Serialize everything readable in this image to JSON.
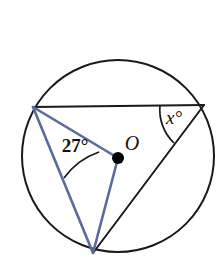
{
  "figure": {
    "type": "circle-geometry-diagram",
    "background_color": "#ffffff",
    "canvas": {
      "width": 223,
      "height": 274
    }
  },
  "colors": {
    "stroke_black": "#1a1a1a",
    "stroke_blue": "#5b6a9c",
    "center_dot": "#000000",
    "text": "#111111",
    "background": "#ffffff"
  },
  "circle": {
    "name": "main-circle",
    "center_x": 118,
    "center_y": 156,
    "radius": 96,
    "stroke_width": 2.0
  },
  "points": {
    "center": {
      "label": "O",
      "x": 118,
      "y": 158
    },
    "left_vertex": {
      "label": "",
      "x": 33,
      "y": 107
    },
    "right_vertex": {
      "label": "",
      "x": 204,
      "y": 105
    },
    "bottom_vertex": {
      "label": "",
      "x": 93,
      "y": 253
    }
  },
  "segments": [
    {
      "name": "chord-top",
      "color": "black",
      "from": "left_vertex",
      "to": "right_vertex",
      "width": 2.0
    },
    {
      "name": "chord-right-to-bottom",
      "color": "black",
      "from": "right_vertex",
      "to": "bottom_vertex",
      "width": 2.0
    },
    {
      "name": "radius-left-to-center",
      "color": "blue",
      "from": "left_vertex",
      "to": "center",
      "width": 2.6
    },
    {
      "name": "chord-left-to-bottom",
      "color": "blue",
      "from": "left_vertex",
      "to": "bottom_vertex",
      "width": 2.6
    },
    {
      "name": "radius-center-to-bottom",
      "color": "blue",
      "from": "center",
      "to": "bottom_vertex",
      "width": 2.6
    }
  ],
  "angles": [
    {
      "id": "angle-27",
      "label": "27°",
      "value": 27,
      "unit": "degrees",
      "vertex": "left_vertex",
      "label_x": 75,
      "label_y": 152,
      "font_size": 19,
      "italic": false,
      "arc_stroke": "#1a1a1a"
    },
    {
      "id": "angle-x",
      "label": "x°",
      "value": null,
      "unit": "degrees",
      "vertex": "right_vertex",
      "label_x": 174,
      "label_y": 124,
      "font_size": 19,
      "italic": true,
      "arc_stroke": "#1a1a1a"
    }
  ],
  "center_label": {
    "name": "center-point-label",
    "text": "O",
    "x": 132,
    "y": 150,
    "font_size": 20
  },
  "center_dot": {
    "name": "center-point-dot",
    "x": 118,
    "y": 158,
    "radius": 6
  }
}
